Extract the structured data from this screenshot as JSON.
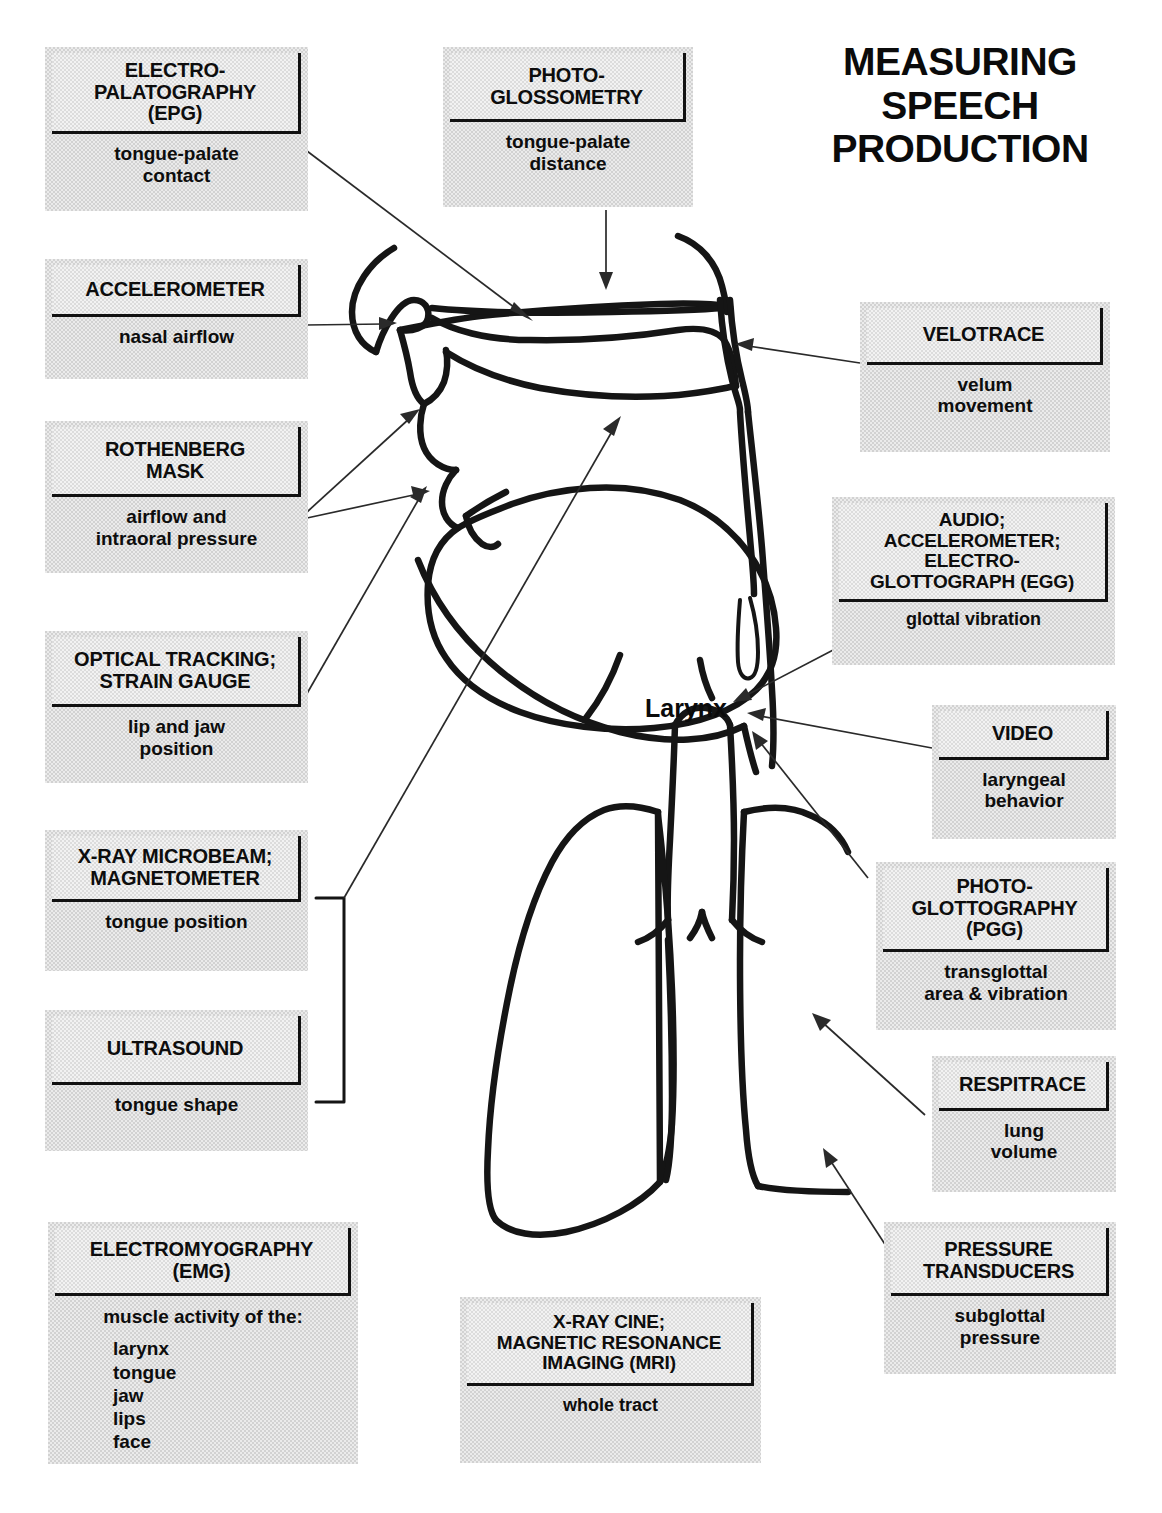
{
  "headline": "MEASURING\nSPEECH\nPRODUCTION",
  "center_label": "Larynx",
  "colors": {
    "box_fill": "#d2d2d2",
    "inner_fill": "#dcdcdc",
    "ink": "#111111",
    "page_background": "#ffffff"
  },
  "boxes": [
    {
      "id": "epg",
      "title": "ELECTRO-\nPALATOGRAPHY\n(EPG)",
      "desc": "tongue-palate\ncontact",
      "measures": "tongue-palate contact"
    },
    {
      "id": "accelerometer",
      "title": "ACCELEROMETER",
      "desc": "nasal airflow",
      "measures": "nasal airflow"
    },
    {
      "id": "rothenberg",
      "title": "ROTHENBERG\nMASK",
      "desc": "airflow and\nintraoral pressure",
      "measures": "airflow and intraoral pressure"
    },
    {
      "id": "optical",
      "title": "OPTICAL TRACKING;\nSTRAIN GAUGE",
      "desc": "lip and jaw\nposition",
      "measures": "lip and jaw position"
    },
    {
      "id": "microbeam",
      "title": "X-RAY MICROBEAM;\nMAGNETOMETER",
      "desc": "tongue position",
      "measures": "tongue position"
    },
    {
      "id": "ultrasound",
      "title": "ULTRASOUND",
      "desc": "tongue shape",
      "measures": "tongue shape"
    },
    {
      "id": "emg",
      "title": "ELECTROMYOGRAPHY\n(EMG)",
      "desc": "muscle activity of the:",
      "desc_list": "larynx\ntongue\njaw\nlips\nface",
      "measures": "muscle activity of the larynx, tongue, jaw, lips, face"
    },
    {
      "id": "photoglossometry",
      "title": "PHOTO-\nGLOSSOMETRY",
      "desc": "tongue-palate\ndistance",
      "measures": "tongue-palate distance"
    },
    {
      "id": "xraycine",
      "title": "X-RAY CINE;\nMAGNETIC RESONANCE\nIMAGING (MRI)",
      "desc": "whole tract",
      "measures": "whole tract"
    },
    {
      "id": "velotrace",
      "title": "VELOTRACE",
      "desc": "velum\nmovement",
      "measures": "velum movement"
    },
    {
      "id": "audio_egg",
      "title": "AUDIO;\nACCELEROMETER;\nELECTRO-\nGLOTTOGRAPH (EGG)",
      "desc": "glottal vibration",
      "measures": "glottal vibration"
    },
    {
      "id": "video",
      "title": "VIDEO",
      "desc": "laryngeal\nbehavior",
      "measures": "laryngeal behavior"
    },
    {
      "id": "pgg",
      "title": "PHOTO-\nGLOTTOGRAPHY\n(PGG)",
      "desc": "transglottal\narea & vibration",
      "measures": "transglottal area & vibration"
    },
    {
      "id": "respitrace",
      "title": "RESPITRACE",
      "desc": "lung\nvolume",
      "measures": "lung volume"
    },
    {
      "id": "pressure",
      "title": "PRESSURE\nTRANSDUCERS",
      "desc": "subglottal\npressure",
      "measures": "subglottal pressure"
    }
  ]
}
